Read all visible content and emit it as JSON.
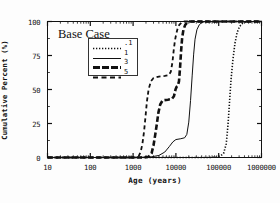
{
  "figure": {
    "annotation": "Base Case",
    "background": "#fdfdfd",
    "foreground": "#111111"
  },
  "chart_data": {
    "type": "line",
    "title": "",
    "annotation": "Base Case",
    "xlabel": "Age  (years)",
    "ylabel": "Cumulative Percent (%)",
    "xscale": "log",
    "xlim": [
      10,
      1000000
    ],
    "ylim": [
      0,
      100
    ],
    "xticks": [
      10,
      100,
      1000,
      10000,
      100000,
      1000000
    ],
    "xticklabels": [
      "10",
      "100",
      "1000",
      "10000",
      "100000",
      "1000000"
    ],
    "yticks": [
      0,
      25,
      50,
      75,
      100
    ],
    "yticklabels": [
      "0",
      "25",
      "50",
      "75",
      "100"
    ],
    "grid": false,
    "legend_position": "upper-left-inside",
    "series": [
      {
        "name": ".1",
        "linestyle": "dotted",
        "linewidth": 1.6,
        "color": "#111111",
        "points": [
          [
            10,
            0
          ],
          [
            1000,
            0
          ],
          [
            20000,
            0
          ],
          [
            60000,
            0
          ],
          [
            90000,
            0.4
          ],
          [
            110000,
            1.2
          ],
          [
            130000,
            3.0
          ],
          [
            150000,
            10.0
          ],
          [
            165000,
            24.0
          ],
          [
            180000,
            42.0
          ],
          [
            195000,
            58.0
          ],
          [
            215000,
            72.0
          ],
          [
            240000,
            84.0
          ],
          [
            270000,
            92.0
          ],
          [
            310000,
            96.5
          ],
          [
            360000,
            98.6
          ],
          [
            430000,
            99.6
          ],
          [
            550000,
            100
          ],
          [
            1000000,
            100
          ]
        ]
      },
      {
        "name": "1",
        "linestyle": "solid",
        "linewidth": 1.0,
        "color": "#111111",
        "points": [
          [
            10,
            0
          ],
          [
            800,
            0
          ],
          [
            2500,
            0.3
          ],
          [
            4000,
            1.5
          ],
          [
            5500,
            4.0
          ],
          [
            7000,
            8.0
          ],
          [
            8500,
            11.5
          ],
          [
            10000,
            13.2
          ],
          [
            13000,
            13.8
          ],
          [
            16000,
            14.5
          ],
          [
            18000,
            17.0
          ],
          [
            20000,
            26.0
          ],
          [
            22000,
            42.0
          ],
          [
            24000,
            60.0
          ],
          [
            26000,
            76.0
          ],
          [
            28000,
            87.0
          ],
          [
            31000,
            94.0
          ],
          [
            35000,
            97.5
          ],
          [
            40000,
            99.2
          ],
          [
            48000,
            99.9
          ],
          [
            60000,
            100
          ],
          [
            1000000,
            100
          ]
        ]
      },
      {
        "name": "3",
        "linestyle": "thick-dash",
        "linewidth": 2.6,
        "color": "#111111",
        "points": [
          [
            10,
            0
          ],
          [
            1800,
            0
          ],
          [
            2300,
            0.5
          ],
          [
            2700,
            3.0
          ],
          [
            3000,
            9.0
          ],
          [
            3300,
            17.0
          ],
          [
            3600,
            25.0
          ],
          [
            3900,
            33.0
          ],
          [
            4300,
            39.0
          ],
          [
            4900,
            42.0
          ],
          [
            6500,
            42.5
          ],
          [
            8000,
            43.0
          ],
          [
            9000,
            45.0
          ],
          [
            9800,
            50.0
          ],
          [
            10400,
            52.0
          ],
          [
            11000,
            52.5
          ],
          [
            11800,
            56.0
          ],
          [
            12500,
            66.0
          ],
          [
            13200,
            78.0
          ],
          [
            14000,
            88.0
          ],
          [
            15000,
            94.0
          ],
          [
            16500,
            97.5
          ],
          [
            18500,
            99.3
          ],
          [
            21000,
            100
          ],
          [
            1000000,
            100
          ]
        ]
      },
      {
        "name": "5",
        "linestyle": "dashed",
        "linewidth": 1.8,
        "color": "#111111",
        "points": [
          [
            10,
            0
          ],
          [
            1100,
            0
          ],
          [
            1350,
            1.0
          ],
          [
            1500,
            4.0
          ],
          [
            1650,
            10.0
          ],
          [
            1800,
            19.0
          ],
          [
            1950,
            30.0
          ],
          [
            2100,
            41.0
          ],
          [
            2300,
            50.0
          ],
          [
            2600,
            56.0
          ],
          [
            3000,
            58.5
          ],
          [
            4000,
            59.5
          ],
          [
            5500,
            60.0
          ],
          [
            6800,
            60.5
          ],
          [
            7600,
            63.0
          ],
          [
            8300,
            70.0
          ],
          [
            8900,
            79.0
          ],
          [
            9500,
            86.0
          ],
          [
            10200,
            91.0
          ],
          [
            11000,
            95.0
          ],
          [
            12000,
            97.5
          ],
          [
            13500,
            99.2
          ],
          [
            15500,
            100
          ],
          [
            1000000,
            100
          ]
        ]
      }
    ]
  },
  "legend": {
    "entries": [
      {
        "label": ".1",
        "style": "dotted"
      },
      {
        "label": "1",
        "style": "solid"
      },
      {
        "label": "3",
        "style": "thick-dash"
      },
      {
        "label": "5",
        "style": "dashed"
      }
    ]
  }
}
